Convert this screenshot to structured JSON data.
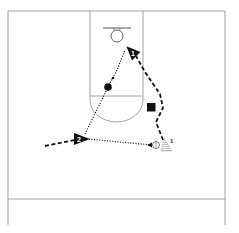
{
  "diagram": {
    "type": "basketball-play-diagram",
    "players": [
      {
        "id": "player-1",
        "label": "1"
      },
      {
        "id": "player-2",
        "label": "2"
      }
    ],
    "coach": {
      "label": "1"
    },
    "colors": {
      "court_lines": "#8a8a8a",
      "markers": "#111111",
      "background": "#ffffff"
    }
  }
}
